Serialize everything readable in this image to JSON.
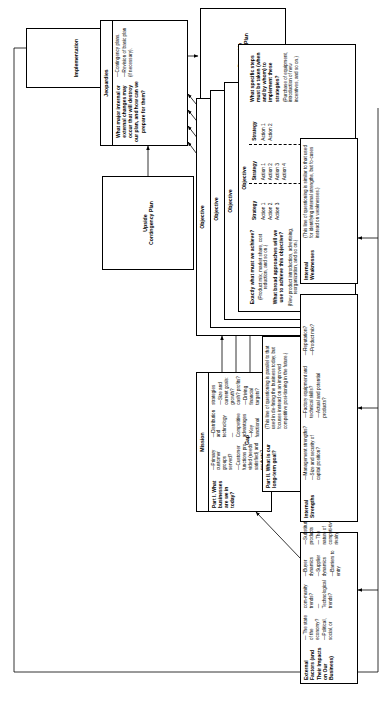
{
  "diagram": {
    "implementation": {
      "label": "Implementation"
    },
    "upside": {
      "label": "Upside\nContingency Plan",
      "line1": "Upside",
      "line2": "Contingency Plan"
    },
    "downside": {
      "label": "Downside\nContingency Plan",
      "line1": "Downside",
      "line2": "Contingency Plan"
    },
    "jeopardies": {
      "header": "Jeopardies",
      "question": "What major internal or external changes may occur that will destroy our plan, and how can we prepare for them?",
      "bullets": [
        "—Contingency plans.",
        "—Revision of basic plan (if necessary)."
      ]
    },
    "objectives": {
      "stack_labels": [
        "Objective",
        "Objective",
        "Objective",
        "Objective"
      ],
      "front_header": "Objective",
      "q1": "Exactly what must we achieve?",
      "q1_example": "(Product mix, market share, cost reduction, and so on.)",
      "q2": "What broad approaches will we use to achieve this objective?",
      "q2_example": "(New product introduction, advertising, reorganization, and so on.)",
      "q3": "What specific steps must be taken (when and by whom) to implement these strategies?",
      "q3_example": "(Purchase of equipment, introduction of new incentives, and so on.)",
      "strategies": [
        {
          "label": "Strategy",
          "actions": [
            "Action 1",
            "Action 2",
            "Action 3"
          ]
        },
        {
          "label": "Strategy",
          "actions": [
            "Action 1",
            "Action 2",
            "Action 3",
            "Action 4"
          ]
        },
        {
          "label": "Strategy",
          "actions": [
            "Action 1",
            "Action 2"
          ]
        }
      ]
    },
    "mission": {
      "header": "Mission",
      "part_title": "Part I. What businesses are we in today?",
      "bullets": [
        "—Primary customer groups served?",
        "—Customer functions pro-vided (needs satisfied) and products?",
        "—Distribution and technology",
        "—Competitive advantages",
        "—Key functional strategies",
        "—Size and current goals: growth? cash? profits?",
        "—Driving financial targets?"
      ]
    },
    "gap": {
      "label": "Gap"
    },
    "part2": {
      "header": "Part II. What is our long-term goal?",
      "note": "(This line of questioning is parallel to that used in de-fining the business today, but focuses instead on an improved competitive posi-tioning in the future.)"
    },
    "external": {
      "header": "External Factors (and Their Impacts on Our Business)",
      "bullets": [
        "— The state of the economy?",
        "—Political, social, or com-munity trends?",
        "—Technological trends?",
        "—Buyer dynamics",
        "—Supplier dynamics",
        "—Barriers to entry",
        "—Substitute products",
        "— The nature of competi-tive rivalry"
      ]
    },
    "strengths": {
      "header": "Internal Strengths",
      "bullets": [
        "—Management strengths?",
        "—Size and security of capital position?",
        "—Factory equipment and technical skills?",
        "—Actual and potential products?",
        "—Reputation?",
        "—Product mix?"
      ]
    },
    "weaknesses": {
      "header": "Internal Weaknesses",
      "note": "(This line of questioning is similar to that used for identifying internal strengths, but fo-cuses instead on weaknesses.)"
    }
  }
}
